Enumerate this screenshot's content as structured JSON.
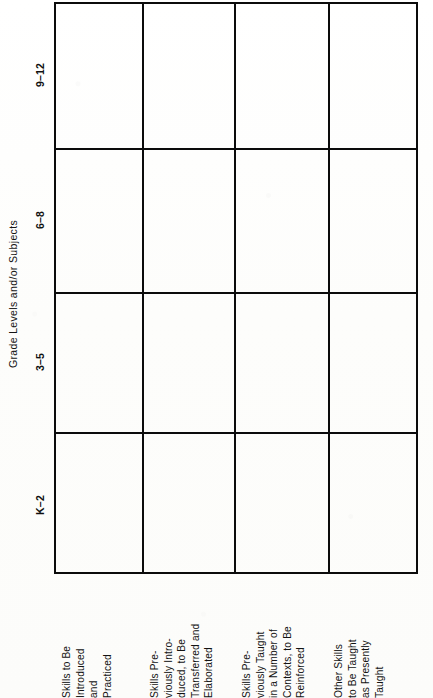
{
  "document": {
    "kind": "scanned-matrix-table",
    "orientation": "rotated-90-ccw",
    "page_background": "#fdfdfc",
    "ink_color": "#0b0b0b"
  },
  "axis": {
    "title": "Grade  Levels  and/or  Subjects"
  },
  "columns": [
    {
      "id": "k-2",
      "label": "K–2"
    },
    {
      "id": "3-5",
      "label": "3–5"
    },
    {
      "id": "6-8",
      "label": "6–8"
    },
    {
      "id": "9-12",
      "label": "9–12"
    }
  ],
  "rows": [
    {
      "id": "skills-introduced-practiced",
      "label": "Skills to Be\nIntroduced\nand\nPracticed"
    },
    {
      "id": "skills-transferred-elaborated",
      "label": "Skills Pre-\nviously Intro-\nduced, to Be\nTransferred and\nElaborated"
    },
    {
      "id": "skills-reinforced",
      "label": "Skills Pre-\nviously Taught\nin a Number of\nContexts, to Be\nReinforced"
    },
    {
      "id": "other-skills-as-presently-taught",
      "label": "Other Skills\nto Be Taught\nas Presently\nTaught"
    }
  ],
  "cells": {
    "content": "",
    "note": "all 16 matrix cells are blank in the scan"
  }
}
